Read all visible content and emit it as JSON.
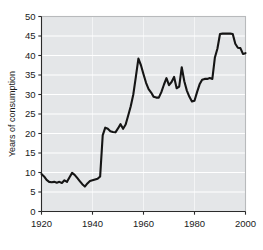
{
  "chart_data": {
    "type": "line",
    "title": "",
    "subtitle": "",
    "xlabel": "",
    "ylabel": "Years of consumption",
    "xlim": [
      1920,
      2000
    ],
    "ylim": [
      0,
      50
    ],
    "xticks": [
      1920,
      1940,
      1960,
      1980,
      2000
    ],
    "yticks": [
      0,
      5,
      10,
      15,
      20,
      25,
      30,
      35,
      40,
      45,
      50
    ],
    "xtick_labels": [
      "1920",
      "1940",
      "1960",
      "1980",
      "2000"
    ],
    "ytick_labels": [
      "0",
      "5",
      "10",
      "15",
      "20",
      "25",
      "30",
      "35",
      "40",
      "45",
      "50"
    ],
    "grid": "horizontal-white",
    "legend": "none",
    "annotations": [],
    "series": [
      {
        "name": "Years of consumption",
        "color": "#151515",
        "x": [
          1920,
          1921,
          1922,
          1923,
          1924,
          1925,
          1926,
          1927,
          1928,
          1929,
          1930,
          1931,
          1932,
          1933,
          1934,
          1935,
          1936,
          1937,
          1938,
          1939,
          1940,
          1941,
          1942,
          1943,
          1944,
          1945,
          1946,
          1947,
          1948,
          1949,
          1950,
          1951,
          1952,
          1953,
          1954,
          1955,
          1956,
          1957,
          1958,
          1959,
          1960,
          1961,
          1962,
          1963,
          1964,
          1965,
          1966,
          1967,
          1968,
          1969,
          1970,
          1971,
          1972,
          1973,
          1974,
          1975,
          1976,
          1977,
          1978,
          1979,
          1980,
          1981,
          1982,
          1983,
          1984,
          1985,
          1986,
          1987,
          1988,
          1989,
          1990,
          1991,
          1992,
          1993,
          1994,
          1995,
          1996,
          1997,
          1998,
          1999,
          2000
        ],
        "y": [
          9.6,
          9.0,
          8.1,
          7.6,
          7.5,
          7.6,
          7.4,
          7.6,
          7.3,
          8.0,
          7.6,
          8.8,
          9.9,
          9.4,
          8.6,
          7.8,
          7.0,
          6.4,
          7.2,
          7.8,
          8.0,
          8.2,
          8.4,
          9.0,
          19.5,
          21.5,
          21.2,
          20.6,
          20.4,
          20.3,
          21.3,
          22.4,
          21.2,
          22.3,
          24.6,
          27.0,
          30.0,
          34.5,
          39.2,
          37.5,
          35.2,
          33.0,
          31.4,
          30.5,
          29.4,
          29.2,
          29.2,
          30.6,
          32.5,
          34.2,
          32.4,
          33.2,
          34.5,
          31.6,
          32.0,
          37.0,
          33.4,
          31.0,
          29.4,
          28.2,
          28.4,
          30.6,
          32.6,
          33.8,
          34.0,
          34.0,
          34.2,
          34.0,
          39.5,
          41.8,
          45.5,
          45.6,
          45.6,
          45.6,
          45.6,
          45.5,
          43.0,
          42.0,
          41.9,
          40.4,
          40.6
        ]
      }
    ]
  }
}
